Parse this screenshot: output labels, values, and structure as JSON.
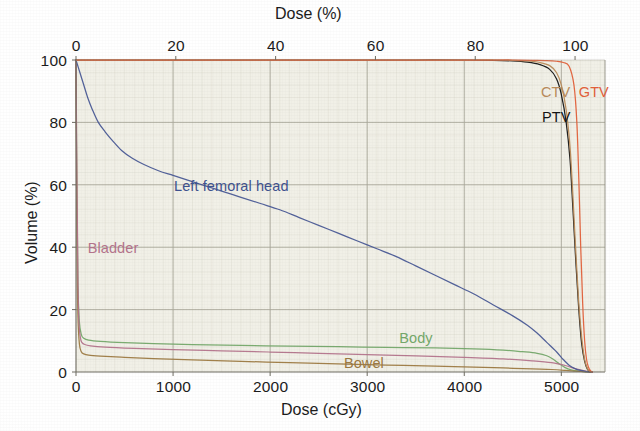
{
  "figure": {
    "kind": "dose-volume-histogram",
    "background_color": "#ffffff",
    "plot_background_color": "#f1f0e7"
  },
  "axes": {
    "top": {
      "title": "Dose (%)",
      "ticks": [
        "0",
        "20",
        "40",
        "60",
        "80",
        "100"
      ],
      "values": [
        0,
        20,
        40,
        60,
        80,
        100
      ],
      "range": [
        0,
        106
      ]
    },
    "bottom": {
      "title": "Dose (cGy)",
      "ticks": [
        "0",
        "1000",
        "2000",
        "3000",
        "4000",
        "5000"
      ],
      "values": [
        0,
        1000,
        2000,
        3000,
        4000,
        5000
      ],
      "range": [
        0,
        5450
      ]
    },
    "left": {
      "title": "Volume (%)",
      "ticks": [
        "0",
        "20",
        "40",
        "60",
        "80",
        "100"
      ],
      "values": [
        0,
        20,
        40,
        60,
        80,
        100
      ],
      "range": [
        0,
        100
      ]
    }
  },
  "annotations": [
    {
      "id": "left-femoral-head",
      "text": "Left femoral head",
      "color": "#3f5390",
      "x": 1010,
      "y": 62
    },
    {
      "id": "bladder",
      "text": "Bladder",
      "color": "#b4748c",
      "x": 120,
      "y": 42
    },
    {
      "id": "body",
      "text": "Body",
      "color": "#74a86a",
      "x": 3330,
      "y": 13
    },
    {
      "id": "bowel",
      "text": "Bowel",
      "color": "#9d7a42",
      "x": 2760,
      "y": 5
    },
    {
      "id": "ctv",
      "text": "CTV",
      "color": "#b98b5a",
      "x": 4790,
      "y": 92
    },
    {
      "id": "gtv",
      "text": "GTV",
      "color": "#e2603a",
      "x": 5180,
      "y": 92
    },
    {
      "id": "ptv",
      "text": "PTV",
      "color": "#141414",
      "x": 4800,
      "y": 84
    }
  ],
  "chart_data": {
    "type": "line",
    "title": "",
    "subtitle": "",
    "xlabel": "Dose (cGy)",
    "xlabel_secondary": "Dose (%)",
    "ylabel": "Volume (%)",
    "xlim": [
      0,
      5450
    ],
    "xlim_percent": [
      0,
      106
    ],
    "ylim": [
      0,
      100
    ],
    "grid": true,
    "legend": "inline-annotations",
    "prescription_dose_cgy": 5040,
    "series": [
      {
        "name": "GTV",
        "color": "#e2603a",
        "points": [
          [
            0,
            100
          ],
          [
            500,
            100
          ],
          [
            1000,
            100
          ],
          [
            1500,
            100
          ],
          [
            2000,
            100
          ],
          [
            2500,
            100
          ],
          [
            3000,
            100
          ],
          [
            3500,
            100
          ],
          [
            4000,
            100
          ],
          [
            4300,
            100
          ],
          [
            4500,
            100
          ],
          [
            4700,
            99.9
          ],
          [
            4850,
            99.8
          ],
          [
            4950,
            99.6
          ],
          [
            5020,
            99.2
          ],
          [
            5080,
            98
          ],
          [
            5130,
            92
          ],
          [
            5160,
            80
          ],
          [
            5180,
            62
          ],
          [
            5200,
            40
          ],
          [
            5220,
            22
          ],
          [
            5240,
            10
          ],
          [
            5260,
            4
          ],
          [
            5280,
            1.5
          ],
          [
            5300,
            0.4
          ],
          [
            5320,
            0
          ]
        ]
      },
      {
        "name": "CTV",
        "color": "#b98b5a",
        "points": [
          [
            0,
            100
          ],
          [
            500,
            100
          ],
          [
            1000,
            100
          ],
          [
            1500,
            100
          ],
          [
            2000,
            100
          ],
          [
            2500,
            100
          ],
          [
            3000,
            100
          ],
          [
            3500,
            100
          ],
          [
            4000,
            100
          ],
          [
            4300,
            100
          ],
          [
            4500,
            99.9
          ],
          [
            4650,
            99.7
          ],
          [
            4780,
            99.2
          ],
          [
            4880,
            98.2
          ],
          [
            4950,
            96
          ],
          [
            5000,
            92
          ],
          [
            5050,
            84
          ],
          [
            5090,
            72
          ],
          [
            5120,
            56
          ],
          [
            5150,
            38
          ],
          [
            5180,
            22
          ],
          [
            5210,
            11
          ],
          [
            5240,
            4
          ],
          [
            5270,
            1
          ],
          [
            5300,
            0
          ]
        ]
      },
      {
        "name": "PTV",
        "color": "#141414",
        "points": [
          [
            0,
            100
          ],
          [
            500,
            100
          ],
          [
            1000,
            100
          ],
          [
            1500,
            100
          ],
          [
            2000,
            100
          ],
          [
            2500,
            100
          ],
          [
            3000,
            100
          ],
          [
            3500,
            100
          ],
          [
            4000,
            100
          ],
          [
            4300,
            99.9
          ],
          [
            4500,
            99.7
          ],
          [
            4650,
            99.3
          ],
          [
            4780,
            98.5
          ],
          [
            4880,
            97
          ],
          [
            4950,
            94
          ],
          [
            5000,
            89
          ],
          [
            5050,
            80
          ],
          [
            5090,
            68
          ],
          [
            5120,
            52
          ],
          [
            5150,
            35
          ],
          [
            5180,
            20
          ],
          [
            5210,
            9
          ],
          [
            5240,
            3.5
          ],
          [
            5270,
            0.8
          ],
          [
            5300,
            0
          ]
        ]
      },
      {
        "name": "Left femoral head",
        "color": "#4a5a96",
        "points": [
          [
            0,
            100
          ],
          [
            40,
            96
          ],
          [
            80,
            92
          ],
          [
            120,
            88
          ],
          [
            170,
            84
          ],
          [
            230,
            80
          ],
          [
            300,
            77
          ],
          [
            380,
            74
          ],
          [
            470,
            71
          ],
          [
            580,
            68.5
          ],
          [
            700,
            66.5
          ],
          [
            850,
            64.5
          ],
          [
            1000,
            63
          ],
          [
            1150,
            61.5
          ],
          [
            1300,
            60
          ],
          [
            1500,
            58
          ],
          [
            1700,
            56
          ],
          [
            1900,
            54
          ],
          [
            2100,
            52
          ],
          [
            2300,
            49.5
          ],
          [
            2500,
            47
          ],
          [
            2700,
            44.5
          ],
          [
            2900,
            42
          ],
          [
            3100,
            39.5
          ],
          [
            3300,
            37
          ],
          [
            3500,
            34
          ],
          [
            3700,
            31
          ],
          [
            3900,
            28
          ],
          [
            4100,
            25
          ],
          [
            4300,
            21.5
          ],
          [
            4500,
            18
          ],
          [
            4650,
            15
          ],
          [
            4750,
            12.5
          ],
          [
            4850,
            9.5
          ],
          [
            4950,
            6.5
          ],
          [
            5020,
            4
          ],
          [
            5080,
            2.2
          ],
          [
            5140,
            1.1
          ],
          [
            5200,
            0.5
          ],
          [
            5260,
            0.15
          ],
          [
            5320,
            0
          ]
        ]
      },
      {
        "name": "Bladder",
        "color": "#b4748c",
        "points": [
          [
            0,
            100
          ],
          [
            10,
            60
          ],
          [
            20,
            30
          ],
          [
            30,
            16
          ],
          [
            45,
            11
          ],
          [
            60,
            9.5
          ],
          [
            90,
            8.8
          ],
          [
            150,
            8.4
          ],
          [
            300,
            8
          ],
          [
            600,
            7.6
          ],
          [
            1000,
            7.2
          ],
          [
            1500,
            6.8
          ],
          [
            2000,
            6.4
          ],
          [
            2500,
            6
          ],
          [
            3000,
            5.6
          ],
          [
            3500,
            5.2
          ],
          [
            4000,
            4.7
          ],
          [
            4400,
            4.2
          ],
          [
            4700,
            3.6
          ],
          [
            4900,
            3
          ],
          [
            5050,
            2
          ],
          [
            5150,
            1
          ],
          [
            5250,
            0.3
          ],
          [
            5320,
            0
          ]
        ]
      },
      {
        "name": "Body",
        "color": "#74a86a",
        "points": [
          [
            0,
            100
          ],
          [
            10,
            55
          ],
          [
            20,
            28
          ],
          [
            35,
            16
          ],
          [
            55,
            12
          ],
          [
            80,
            10.8
          ],
          [
            130,
            10.2
          ],
          [
            250,
            9.8
          ],
          [
            500,
            9.4
          ],
          [
            800,
            9.1
          ],
          [
            1200,
            8.8
          ],
          [
            1700,
            8.5
          ],
          [
            2200,
            8.3
          ],
          [
            2700,
            8.1
          ],
          [
            3200,
            7.9
          ],
          [
            3700,
            7.7
          ],
          [
            4100,
            7.4
          ],
          [
            4400,
            7
          ],
          [
            4600,
            6.5
          ],
          [
            4750,
            6
          ],
          [
            4850,
            5.2
          ],
          [
            4920,
            4
          ],
          [
            4980,
            2.6
          ],
          [
            5040,
            1.4
          ],
          [
            5100,
            0.7
          ],
          [
            5180,
            0.25
          ],
          [
            5260,
            0.05
          ],
          [
            5320,
            0
          ]
        ]
      },
      {
        "name": "Bowel",
        "color": "#9d7a42",
        "points": [
          [
            0,
            100
          ],
          [
            10,
            40
          ],
          [
            20,
            18
          ],
          [
            35,
            9
          ],
          [
            55,
            6.5
          ],
          [
            80,
            5.8
          ],
          [
            130,
            5.4
          ],
          [
            250,
            5.1
          ],
          [
            500,
            4.7
          ],
          [
            800,
            4.3
          ],
          [
            1200,
            3.9
          ],
          [
            1700,
            3.4
          ],
          [
            2200,
            3
          ],
          [
            2700,
            2.6
          ],
          [
            3200,
            2.2
          ],
          [
            3700,
            1.9
          ],
          [
            4100,
            1.6
          ],
          [
            4400,
            1.3
          ],
          [
            4700,
            1
          ],
          [
            4900,
            0.8
          ],
          [
            5050,
            0.5
          ],
          [
            5150,
            0.25
          ],
          [
            5250,
            0.07
          ],
          [
            5320,
            0
          ]
        ]
      }
    ]
  }
}
